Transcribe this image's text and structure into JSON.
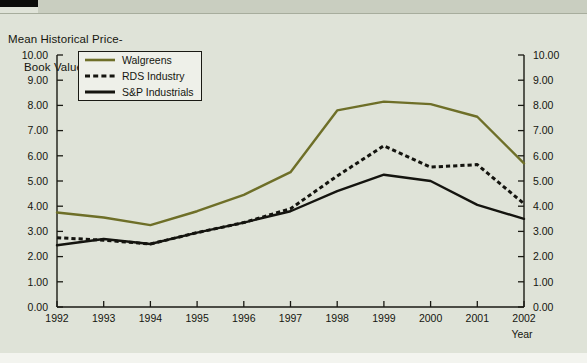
{
  "chart_title_line1": "Mean Historical Price-",
  "chart_title_line2": "Book Value Ratios",
  "axis": {
    "x_name": "Year",
    "y_left_ticks": [
      "10.00",
      "9.00",
      "8.00",
      "7.00",
      "6.00",
      "5.00",
      "4.00",
      "3.00",
      "2.00",
      "1.00",
      "0.00"
    ],
    "y_right_ticks": [
      "10.00",
      "9.00",
      "8.00",
      "7.00",
      "6.00",
      "5.00",
      "4.00",
      "3.00",
      "2.00",
      "1.00",
      "0.00"
    ]
  },
  "legend": {
    "items": [
      {
        "label": "Walgreens",
        "color": "#6e6f28",
        "style": "solid",
        "icon": "solid-line-swatch"
      },
      {
        "label": "RDS Industry",
        "color": "#14140f",
        "style": "dashed",
        "icon": "dashed-line-swatch"
      },
      {
        "label": "S&P Industrials",
        "color": "#14140f",
        "style": "solid",
        "icon": "solid-line-swatch"
      }
    ]
  },
  "colors": {
    "background": "#dfe3d8",
    "plot_background": "#dfe3d8",
    "axis": "#1a1a14",
    "walgreens": "#6e6f28",
    "rds_industry": "#14140f",
    "sp_industrials": "#14140f"
  },
  "chart_data": {
    "type": "line",
    "subtitle": "",
    "xlabel": "Year",
    "ylabel": "",
    "x": [
      "1992",
      "1993",
      "1994",
      "1995",
      "1996",
      "1997",
      "1998",
      "1999",
      "2000",
      "2001",
      "2002"
    ],
    "categories": [
      "1992",
      "1993",
      "1994",
      "1995",
      "1996",
      "1997",
      "1998",
      "1999",
      "2000",
      "2001",
      "2002"
    ],
    "xlim": [
      "1992",
      "2002"
    ],
    "ylim": [
      0.0,
      10.0
    ],
    "ytick_step": 1.0,
    "grid": false,
    "legend_position": "upper-left-inside",
    "dual_y_axis": true,
    "series": [
      {
        "name": "Walgreens",
        "color": "#6e6f28",
        "style": "solid",
        "values": [
          3.75,
          3.55,
          3.25,
          3.8,
          4.45,
          5.35,
          7.8,
          8.15,
          8.05,
          7.55,
          5.7
        ]
      },
      {
        "name": "RDS Industry",
        "color": "#14140f",
        "style": "dashed",
        "values": [
          2.75,
          2.65,
          2.5,
          2.95,
          3.35,
          3.9,
          5.2,
          6.4,
          5.55,
          5.65,
          4.1
        ]
      },
      {
        "name": "S&P Industrials",
        "color": "#14140f",
        "style": "solid",
        "values": [
          2.45,
          2.7,
          2.5,
          2.95,
          3.35,
          3.8,
          4.6,
          5.25,
          5.0,
          4.05,
          3.5
        ]
      }
    ]
  }
}
